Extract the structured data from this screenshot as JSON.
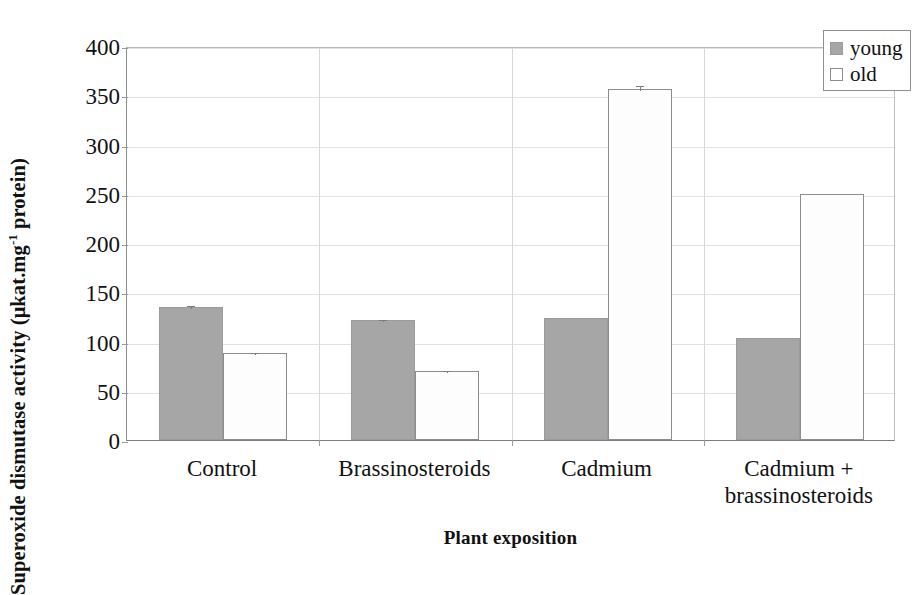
{
  "chart_data": {
    "type": "bar",
    "title": "",
    "xlabel": "Plant exposition",
    "ylabel": "Superoxide dismutase activity (μkat.mg⁻¹ protein)",
    "ylabel_parts": {
      "main_a": "Superoxide dismutase activity (μkat.mg",
      "sup": "-1",
      "main_b": " protein)"
    },
    "categories": [
      "Control",
      "Brassinosteroids",
      "Cadmium",
      "Cadmium +\nbrassinosteroids"
    ],
    "category_lines": [
      [
        "Control"
      ],
      [
        "Brassinosteroids"
      ],
      [
        "Cadmium"
      ],
      [
        "Cadmium +",
        "brassinosteroids"
      ]
    ],
    "series": [
      {
        "name": "young",
        "color": "#a6a6a6",
        "values": [
          135,
          122,
          124,
          104
        ],
        "errors": [
          3,
          2,
          0,
          0
        ]
      },
      {
        "name": "old",
        "color": "#ffffff",
        "values": [
          88,
          70,
          356,
          250
        ],
        "errors": [
          2,
          2,
          5,
          0
        ]
      }
    ],
    "ylim": [
      0,
      400
    ],
    "yticks": [
      0,
      50,
      100,
      150,
      200,
      250,
      300,
      350,
      400
    ],
    "ytick_labels": [
      "0",
      "50",
      "100",
      "150",
      "200",
      "250",
      "300",
      "350",
      "400"
    ],
    "grid": true,
    "legend_position": "top-right",
    "legend_entries": [
      "young",
      "old"
    ]
  },
  "legend": {
    "entries": [
      {
        "label": "young",
        "swatch": "young"
      },
      {
        "label": "old",
        "swatch": "old"
      }
    ]
  },
  "axes": {
    "y_title_a": "Superoxide dismutase activity (μkat.mg",
    "y_title_sup": "-1",
    "y_title_b": " protein)",
    "x_title": "Plant exposition"
  }
}
